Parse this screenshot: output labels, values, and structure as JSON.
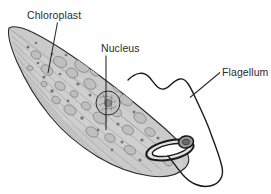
{
  "diagram": {
    "background_color": "#ffffff",
    "line_color": "#2b2b2b",
    "cell_fill_color": "#c9c9c9",
    "cell_fill_color_light": "#d8d8d8",
    "organelle_stroke_color": "#6e6e6e",
    "nucleus_fill_color": "#bdbdbd",
    "eyespot_fill_color": "#8f8f8f",
    "labels": [
      {
        "id": "chloroplast",
        "text": "Chloroplast",
        "text_x": 27,
        "text_y": 19,
        "leader": "M57.5,22.5 L48,73"
      },
      {
        "id": "nucleus",
        "text": "Nucleus",
        "text_x": 101,
        "text_y": 52,
        "leader": "M106,55.5 L106,130"
      },
      {
        "id": "flagellum",
        "text": "Flagellum",
        "text_x": 222,
        "text_y": 76,
        "leader": "M220,72.5 L190,97.5"
      }
    ],
    "structures": {
      "cell_body_name": "cell-body",
      "nucleus_name": "nucleus",
      "eyespot_name": "eyespot",
      "reservoir_name": "reservoir-loop",
      "flagellum_name": "flagellum-filament",
      "pellicle_name": "pellicle-striations",
      "chloroplast_name": "chloroplast"
    }
  }
}
